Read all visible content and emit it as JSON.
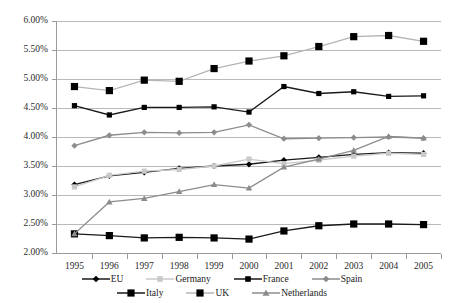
{
  "chart_data": {
    "type": "line",
    "title": "",
    "xlabel": "",
    "ylabel": "",
    "categories": [
      "1995",
      "1996",
      "1997",
      "1998",
      "1999",
      "2000",
      "2001",
      "2002",
      "2003",
      "2004",
      "2005"
    ],
    "ylim": [
      2.0,
      6.0
    ],
    "ytick_step": 0.5,
    "ytick_labels": [
      "6.00%",
      "5.50%",
      "5.00%",
      "4.50%",
      "4.00%",
      "3.50%",
      "3.00%",
      "2.50%",
      "2.00%"
    ],
    "ytick_values": [
      6.0,
      5.5,
      5.0,
      4.5,
      4.0,
      3.5,
      3.0,
      2.5,
      2.0
    ],
    "grid": true,
    "legend_position": "bottom",
    "value_unit": "%",
    "series": [
      {
        "name": "EU",
        "marker": "diamond",
        "color": "#000000",
        "line_color": "#1a1a1a",
        "values": [
          3.18,
          3.33,
          3.39,
          3.46,
          3.5,
          3.53,
          3.6,
          3.65,
          3.7,
          3.73,
          3.72
        ]
      },
      {
        "name": "Germany",
        "marker": "square",
        "color": "#c9c9c9",
        "line_color": "#c9c9c9",
        "values": [
          3.14,
          3.34,
          3.41,
          3.44,
          3.5,
          3.62,
          3.54,
          3.6,
          3.67,
          3.72,
          3.7
        ]
      },
      {
        "name": "France",
        "marker": "square",
        "color": "#000000",
        "line_color": "#1a1a1a",
        "values": [
          4.54,
          4.38,
          4.51,
          4.51,
          4.52,
          4.43,
          4.87,
          4.75,
          4.78,
          4.7,
          4.71
        ]
      },
      {
        "name": "Spain",
        "marker": "diamond",
        "color": "#8c8c8c",
        "line_color": "#8c8c8c",
        "values": [
          3.85,
          4.03,
          4.08,
          4.07,
          4.08,
          4.21,
          3.97,
          3.98,
          3.99,
          4.0,
          3.98
        ]
      },
      {
        "name": "Italy",
        "marker": "square",
        "color": "#000000",
        "line_color": "#1a1a1a",
        "values": [
          2.33,
          2.3,
          2.26,
          2.27,
          2.26,
          2.24,
          2.38,
          2.47,
          2.5,
          2.5,
          2.49
        ]
      },
      {
        "name": "UK",
        "marker": "square",
        "color": "#000000",
        "line_color": "#b5b5b5",
        "values": [
          4.87,
          4.8,
          4.98,
          4.96,
          5.18,
          5.31,
          5.4,
          5.56,
          5.73,
          5.75,
          5.65
        ]
      },
      {
        "name": "Netherlands",
        "marker": "triangle",
        "color": "#8c8c8c",
        "line_color": "#8c8c8c",
        "values": [
          2.33,
          2.88,
          2.94,
          3.06,
          3.18,
          3.12,
          3.48,
          3.62,
          3.77,
          4.01,
          3.98
        ]
      }
    ]
  },
  "legend": {
    "rows": [
      [
        "EU",
        "Germany",
        "France",
        "Spain"
      ],
      [
        "Italy",
        "UK",
        "Netherlands"
      ]
    ]
  }
}
